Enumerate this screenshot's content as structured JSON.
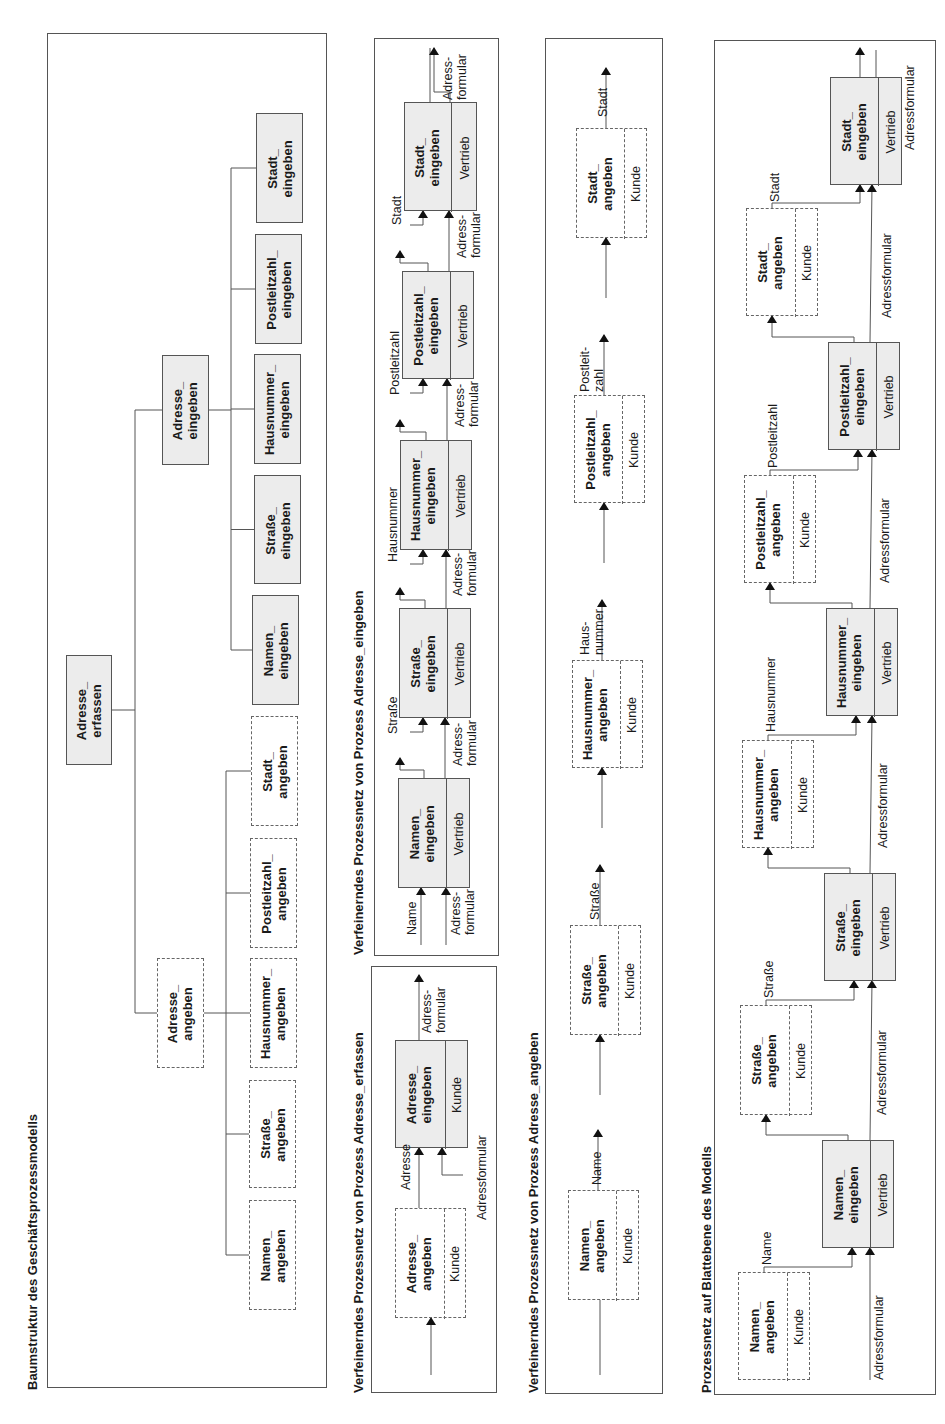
{
  "document": {
    "orientation": "rotated -90deg (text reads bottom-to-top)",
    "colors": {
      "background": "#ffffff",
      "line": "#555555",
      "solid_box_fill": "#ececec",
      "text": "#1a1a1a"
    }
  },
  "panels": [
    {
      "id": "tree",
      "title": "Baumstruktur des Geschäftsprozessmodells",
      "rect": {
        "x": 47,
        "y": 33,
        "w": 280,
        "h": 355,
        "h_full": 1355
      },
      "title_pos": {
        "x": 26,
        "y": 1390
      }
    },
    {
      "id": "verfeinernd-erfassen",
      "title": "Verfeinerndes Prozessnetz von Prozess Adresse_erfassen",
      "rect": {
        "x": 371,
        "y": 966,
        "w": 126,
        "h": 427
      },
      "title_pos": {
        "x": 352,
        "y": 1393
      }
    },
    {
      "id": "verfeinernd-eingeben",
      "title": "Verfeinerndes Prozessnetz von Prozess Adresse_eingeben",
      "rect": {
        "x": 374,
        "y": 38,
        "w": 125,
        "h": 918
      },
      "title_pos": {
        "x": 352,
        "y": 955
      }
    },
    {
      "id": "verfeinernd-angeben",
      "title": "Verfeinerndes Prozessnetz von Prozess Adresse_angeben",
      "rect": {
        "x": 545,
        "y": 38,
        "w": 118,
        "h": 1356
      },
      "title_pos": {
        "x": 527,
        "y": 1393
      }
    },
    {
      "id": "blattebene",
      "title": "Prozessnetz auf Blattebene des Modells",
      "rect": {
        "x": 714,
        "y": 40,
        "w": 222,
        "h": 1355
      },
      "title_pos": {
        "x": 700,
        "y": 1393
      }
    }
  ],
  "tree": {
    "root": {
      "label": "Adresse_\nerfassen",
      "style": "solid",
      "rect": {
        "x": 66,
        "y": 655,
        "w": 46,
        "h": 110
      }
    },
    "level2": [
      {
        "label": "Adresse_\nangeben",
        "style": "dashed",
        "rect": {
          "x": 157,
          "y": 958,
          "w": 47,
          "h": 110
        }
      },
      {
        "label": "Adresse_\neingeben",
        "style": "solid",
        "rect": {
          "x": 162,
          "y": 355,
          "w": 47,
          "h": 110
        }
      }
    ],
    "angeben_children": [
      {
        "label": "Namen_\nangeben",
        "style": "dashed",
        "rect": {
          "x": 249,
          "y": 1200,
          "w": 47,
          "h": 110
        }
      },
      {
        "label": "Straße_\nangeben",
        "style": "dashed",
        "rect": {
          "x": 249,
          "y": 1080,
          "w": 47,
          "h": 108
        }
      },
      {
        "label": "Hausnummer_\nangeben",
        "style": "dashed",
        "rect": {
          "x": 250,
          "y": 958,
          "w": 47,
          "h": 110
        }
      },
      {
        "label": "Postleitzahl_\nangeben",
        "style": "dashed",
        "rect": {
          "x": 250,
          "y": 838,
          "w": 47,
          "h": 110
        }
      },
      {
        "label": "Stadt_\nangeben",
        "style": "dashed",
        "rect": {
          "x": 251,
          "y": 716,
          "w": 47,
          "h": 110
        }
      }
    ],
    "eingeben_children": [
      {
        "label": "Namen_\neingeben",
        "style": "solid",
        "rect": {
          "x": 252,
          "y": 595,
          "w": 47,
          "h": 110
        }
      },
      {
        "label": "Straße_\neingeben",
        "style": "solid",
        "rect": {
          "x": 254,
          "y": 475,
          "w": 47,
          "h": 109
        }
      },
      {
        "label": "Hausnummer_\neingeben",
        "style": "solid",
        "rect": {
          "x": 254,
          "y": 354,
          "w": 47,
          "h": 110
        }
      },
      {
        "label": "Postleitzahl_\neingeben",
        "style": "solid",
        "rect": {
          "x": 255,
          "y": 234,
          "w": 47,
          "h": 110
        }
      },
      {
        "label": "Stadt_\neingeben",
        "style": "solid",
        "rect": {
          "x": 256,
          "y": 113,
          "w": 47,
          "h": 110
        }
      }
    ]
  },
  "net_erfassen": {
    "boxes": [
      {
        "label": "Adresse_\nangeben",
        "role": "Kunde",
        "style": "dashed",
        "rect": {
          "x": 395,
          "y": 1208,
          "w": 71,
          "h": 110
        },
        "split": 48
      },
      {
        "label": "Adresse_\neingeben",
        "role": "Kunde",
        "style": "solid",
        "rect": {
          "x": 395,
          "y": 1040,
          "w": 73,
          "h": 108
        },
        "split": 49
      }
    ],
    "flows": [
      {
        "label": "Adresse",
        "x": 399,
        "y": 1190
      },
      {
        "label": "Adressformular",
        "x": 475,
        "y": 1220
      },
      {
        "label": "Adress-\nformular",
        "x": 420,
        "y": 1033
      }
    ]
  },
  "net_eingeben": {
    "boxes": [
      {
        "label": "Namen_\neingeben",
        "role": "Vertrieb",
        "style": "solid",
        "rect": {
          "x": 398,
          "y": 778,
          "w": 72,
          "h": 110
        },
        "split": 47
      },
      {
        "label": "Straße_\neingeben",
        "role": "Vertrieb",
        "style": "solid",
        "rect": {
          "x": 399,
          "y": 608,
          "w": 72,
          "h": 110
        },
        "split": 47
      },
      {
        "label": "Hausnummer_\neingeben",
        "role": "Vertrieb",
        "style": "solid",
        "rect": {
          "x": 400,
          "y": 440,
          "w": 72,
          "h": 110
        },
        "split": 47
      },
      {
        "label": "Postleitzahl_\neingeben",
        "role": "Vertrieb",
        "style": "solid",
        "rect": {
          "x": 402,
          "y": 271,
          "w": 72,
          "h": 108
        },
        "split": 47
      },
      {
        "label": "Stadt_\neingeben",
        "role": "Vertrieb",
        "style": "solid",
        "rect": {
          "x": 404,
          "y": 102,
          "w": 73,
          "h": 109
        },
        "split": 46
      }
    ],
    "flows": [
      {
        "label": "Name",
        "x": 405,
        "y": 935
      },
      {
        "label": "Adress-\nformular",
        "x": 449,
        "y": 935
      },
      {
        "label": "Straße",
        "x": 386,
        "y": 734
      },
      {
        "label": "Adress-\nformular",
        "x": 451,
        "y": 766
      },
      {
        "label": "Hausnummer",
        "x": 386,
        "y": 562
      },
      {
        "label": "Adress-\nformular",
        "x": 451,
        "y": 596
      },
      {
        "label": "Postleitzahl",
        "x": 388,
        "y": 395
      },
      {
        "label": "Adress-\nformular",
        "x": 453,
        "y": 427
      },
      {
        "label": "Stadt",
        "x": 390,
        "y": 225
      },
      {
        "label": "Adress-\nformular",
        "x": 455,
        "y": 258
      },
      {
        "label": "Adress-\nformular",
        "x": 441,
        "y": 100
      }
    ]
  },
  "net_angeben": {
    "boxes": [
      {
        "label": "Namen_\nangeben",
        "role": "Kunde",
        "style": "dashed",
        "rect": {
          "x": 568,
          "y": 1190,
          "w": 71,
          "h": 110
        },
        "split": 47
      },
      {
        "label": "Straße_\nangeben",
        "role": "Kunde",
        "style": "dashed",
        "rect": {
          "x": 570,
          "y": 925,
          "w": 71,
          "h": 110
        },
        "split": 47
      },
      {
        "label": "Hausnummer_\nangeben",
        "role": "Kunde",
        "style": "dashed",
        "rect": {
          "x": 572,
          "y": 660,
          "w": 71,
          "h": 108
        },
        "split": 47
      },
      {
        "label": "Postleitzahl_\nangeben",
        "role": "Kunde",
        "style": "dashed",
        "rect": {
          "x": 574,
          "y": 395,
          "w": 71,
          "h": 108
        },
        "split": 47
      },
      {
        "label": "Stadt_\nangeben",
        "role": "Kunde",
        "style": "dashed",
        "rect": {
          "x": 576,
          "y": 128,
          "w": 71,
          "h": 110
        },
        "split": 47
      }
    ],
    "flows": [
      {
        "label": "Name",
        "x": 590,
        "y": 1185
      },
      {
        "label": "Straße",
        "x": 588,
        "y": 920
      },
      {
        "label": "Haus-\nnummer",
        "x": 578,
        "y": 655
      },
      {
        "label": "Postleit-\nzahl",
        "x": 578,
        "y": 392
      },
      {
        "label": "Stadt",
        "x": 596,
        "y": 117
      }
    ]
  },
  "net_blatt": {
    "boxes": [
      {
        "label": "Namen_\nangeben",
        "role": "Kunde",
        "style": "dashed",
        "rect": {
          "x": 738,
          "y": 1272,
          "w": 72,
          "h": 108
        },
        "split": 48
      },
      {
        "label": "Namen_\neingeben",
        "role": "Vertrieb",
        "style": "solid",
        "rect": {
          "x": 822,
          "y": 1140,
          "w": 72,
          "h": 108
        },
        "split": 47
      },
      {
        "label": "Straße_\nangeben",
        "role": "Kunde",
        "style": "dashed",
        "rect": {
          "x": 740,
          "y": 1005,
          "w": 72,
          "h": 110
        },
        "split": 48
      },
      {
        "label": "Straße_\neingeben",
        "role": "Vertrieb",
        "style": "solid",
        "rect": {
          "x": 824,
          "y": 873,
          "w": 72,
          "h": 108
        },
        "split": 47
      },
      {
        "label": "Hausnummer_\nangeben",
        "role": "Kunde",
        "style": "dashed",
        "rect": {
          "x": 742,
          "y": 740,
          "w": 72,
          "h": 108
        },
        "split": 48
      },
      {
        "label": "Hausnummer_\neingeben",
        "role": "Vertrieb",
        "style": "solid",
        "rect": {
          "x": 826,
          "y": 608,
          "w": 72,
          "h": 108
        },
        "split": 47
      },
      {
        "label": "Postleitzahl_\nangeben",
        "role": "Kunde",
        "style": "dashed",
        "rect": {
          "x": 744,
          "y": 475,
          "w": 72,
          "h": 108
        },
        "split": 48
      },
      {
        "label": "Postleitzahl_\neingeben",
        "role": "Vertrieb",
        "style": "solid",
        "rect": {
          "x": 828,
          "y": 342,
          "w": 72,
          "h": 108
        },
        "split": 47
      },
      {
        "label": "Stadt_\nangeben",
        "role": "Kunde",
        "style": "dashed",
        "rect": {
          "x": 746,
          "y": 208,
          "w": 72,
          "h": 108
        },
        "split": 48
      },
      {
        "label": "Stadt_\neingeben",
        "role": "Vertrieb",
        "style": "solid",
        "rect": {
          "x": 830,
          "y": 77,
          "w": 72,
          "h": 108
        },
        "split": 47
      }
    ],
    "flows": [
      {
        "label": "Name",
        "x": 760,
        "y": 1265
      },
      {
        "label": "Adressformular",
        "x": 872,
        "y": 1380
      },
      {
        "label": "Straße",
        "x": 762,
        "y": 998
      },
      {
        "label": "Adressformular",
        "x": 875,
        "y": 1115
      },
      {
        "label": "Hausnummer",
        "x": 764,
        "y": 732
      },
      {
        "label": "Adressformular",
        "x": 876,
        "y": 848
      },
      {
        "label": "Postleitzahl",
        "x": 766,
        "y": 468
      },
      {
        "label": "Adressformular",
        "x": 878,
        "y": 583
      },
      {
        "label": "Stadt",
        "x": 768,
        "y": 202
      },
      {
        "label": "Adressformular",
        "x": 880,
        "y": 318
      },
      {
        "label": "Adressformular",
        "x": 903,
        "y": 150
      }
    ]
  }
}
